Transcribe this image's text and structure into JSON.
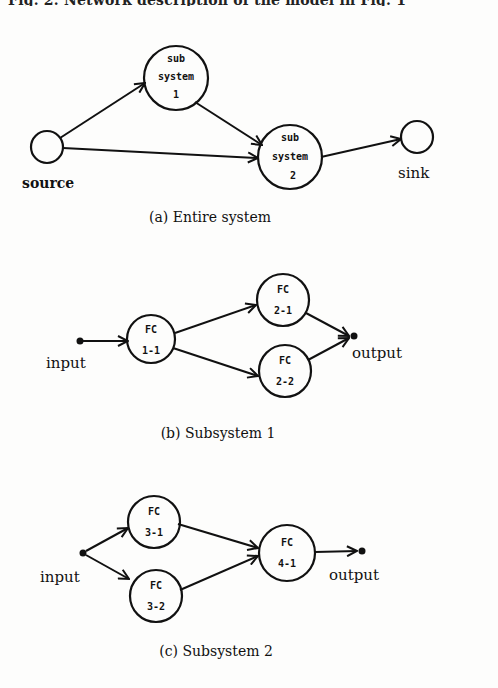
{
  "figure": {
    "top_caption": "Fig. 2. Network description of the model in Fig. 1",
    "panels": [
      {
        "id": "a",
        "caption": "(a)  Entire system",
        "nodes": [
          {
            "id": "source",
            "label": "source",
            "type": "terminal"
          },
          {
            "id": "subsystem-1",
            "lines": [
              "sub",
              "system",
              "1"
            ]
          },
          {
            "id": "subsystem-2",
            "lines": [
              "sub",
              "system",
              "2"
            ]
          },
          {
            "id": "sink",
            "label": "sink",
            "type": "terminal"
          }
        ],
        "edges": [
          [
            "source",
            "subsystem-1"
          ],
          [
            "source",
            "subsystem-2"
          ],
          [
            "subsystem-1",
            "subsystem-2"
          ],
          [
            "subsystem-2",
            "sink"
          ]
        ]
      },
      {
        "id": "b",
        "caption": "(b)  Subsystem 1",
        "input_label": "input",
        "output_label": "output",
        "nodes": [
          {
            "id": "fc-1-1",
            "lines": [
              "FC",
              "1-1"
            ]
          },
          {
            "id": "fc-2-1",
            "lines": [
              "FC",
              "2-1"
            ]
          },
          {
            "id": "fc-2-2",
            "lines": [
              "FC",
              "2-2"
            ]
          }
        ],
        "edges": [
          [
            "input",
            "fc-1-1"
          ],
          [
            "fc-1-1",
            "fc-2-1"
          ],
          [
            "fc-1-1",
            "fc-2-2"
          ],
          [
            "fc-2-1",
            "output"
          ],
          [
            "fc-2-2",
            "output"
          ]
        ]
      },
      {
        "id": "c",
        "caption": "(c)  Subsystem 2",
        "input_label": "input",
        "output_label": "output",
        "nodes": [
          {
            "id": "fc-3-1",
            "lines": [
              "FC",
              "3-1"
            ]
          },
          {
            "id": "fc-3-2",
            "lines": [
              "FC",
              "3-2"
            ]
          },
          {
            "id": "fc-4-1",
            "lines": [
              "FC",
              "4-1"
            ]
          }
        ],
        "edges": [
          [
            "input",
            "fc-3-1"
          ],
          [
            "input",
            "fc-3-2"
          ],
          [
            "fc-3-1",
            "fc-4-1"
          ],
          [
            "fc-3-2",
            "fc-4-1"
          ],
          [
            "fc-4-1",
            "output"
          ]
        ]
      }
    ]
  }
}
